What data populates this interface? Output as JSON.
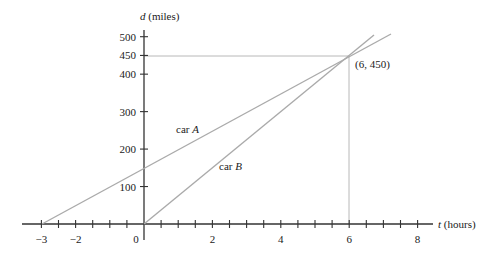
{
  "chart_data": {
    "type": "line",
    "title": "",
    "xlabel": "t (hours)",
    "ylabel": "d (miles)",
    "xlabel_var": "t",
    "xlabel_unit": "(hours)",
    "ylabel_var": "d",
    "ylabel_unit": "(miles)",
    "xlim": [
      -3,
      8
    ],
    "ylim": [
      0,
      510
    ],
    "x_tick_labels": [
      "−3",
      "−2",
      "0",
      "2",
      "4",
      "6",
      "8"
    ],
    "x_tick_values": [
      -3,
      -2,
      0,
      2,
      4,
      6,
      8
    ],
    "x_minor_tick_step": 0.5,
    "y_tick_labels": [
      "100",
      "200",
      "300",
      "400",
      "450",
      "500"
    ],
    "y_tick_values": [
      100,
      200,
      300,
      400,
      450,
      500
    ],
    "grid": false,
    "series": [
      {
        "name": "car A",
        "label_var": "A",
        "x": [
          -3,
          0,
          6,
          7.2
        ],
        "y": [
          0,
          150,
          450,
          510
        ],
        "equation": "d = 50t + 150"
      },
      {
        "name": "car B",
        "label_var": "B",
        "x": [
          0,
          6,
          6.7
        ],
        "y": [
          0,
          450,
          502
        ],
        "equation": "d = 75t"
      }
    ],
    "annotations": [
      {
        "text": "(6, 450)",
        "x": 6,
        "y": 450,
        "note": "intersection point with dashed guides to axes"
      }
    ],
    "legend": "none (inline labels)"
  },
  "labels": {
    "car_a_prefix": "car ",
    "car_a_var": "A",
    "car_b_prefix": "car ",
    "car_b_var": "B",
    "intersection": "(6, 450)",
    "x_axis_var": "t",
    "x_axis_unit": " (hours)",
    "y_axis_var": "d",
    "y_axis_unit": " (miles)"
  }
}
